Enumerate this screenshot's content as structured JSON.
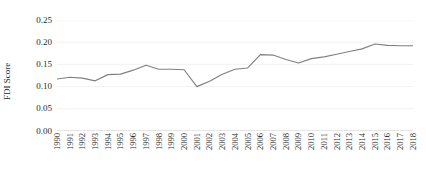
{
  "chart_data": {
    "type": "line",
    "title": "",
    "xlabel": "",
    "ylabel": "FDI Score",
    "ylim": [
      0.0,
      0.25
    ],
    "ytick_labels": [
      "0.25",
      "0.20",
      "0.15",
      "0.10",
      "0.05",
      "0.00"
    ],
    "ytick_values": [
      0.25,
      0.2,
      0.15,
      0.1,
      0.05,
      0.0
    ],
    "grid": true,
    "legend": "none",
    "line_color": "#808080",
    "categories": [
      "1990",
      "1991",
      "1992",
      "1993",
      "1994",
      "1995",
      "1996",
      "1997",
      "1998",
      "1999",
      "2000",
      "2001",
      "2002",
      "2003",
      "2004",
      "2005",
      "2006",
      "2007",
      "2008",
      "2009",
      "2010",
      "2011",
      "2012",
      "2013",
      "2014",
      "2015",
      "2016",
      "2017",
      "2018"
    ],
    "x": [
      1990,
      1991,
      1992,
      1993,
      1994,
      1995,
      1996,
      1997,
      1998,
      1999,
      2000,
      2001,
      2002,
      2003,
      2004,
      2005,
      2006,
      2007,
      2008,
      2009,
      2010,
      2011,
      2012,
      2013,
      2014,
      2015,
      2016,
      2017,
      2018
    ],
    "series": [
      {
        "name": "FDI Score",
        "values": [
          0.117,
          0.121,
          0.119,
          0.113,
          0.127,
          0.128,
          0.137,
          0.148,
          0.139,
          0.139,
          0.138,
          0.1,
          0.112,
          0.128,
          0.139,
          0.142,
          0.172,
          0.171,
          0.161,
          0.153,
          0.163,
          0.167,
          0.173,
          0.179,
          0.185,
          0.196,
          0.193,
          0.192,
          0.192
        ]
      }
    ]
  }
}
